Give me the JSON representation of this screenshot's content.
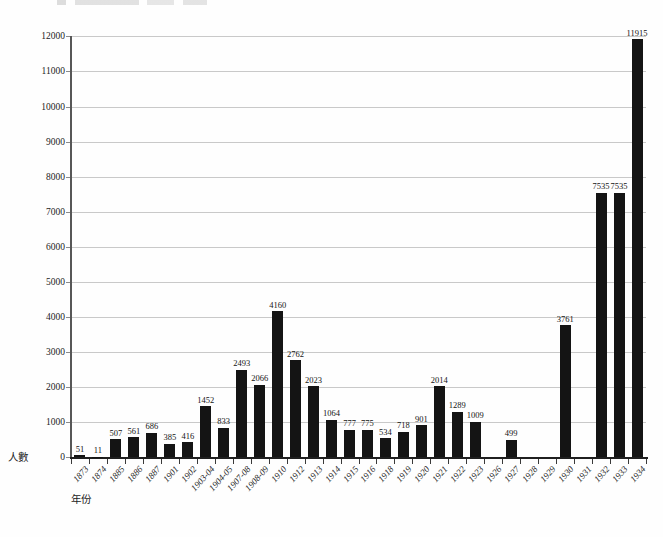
{
  "chart_data": {
    "type": "bar",
    "title": "",
    "xlabel": "年份",
    "ylabel": "人數",
    "categories": [
      "1873",
      "1874",
      "1885",
      "1886",
      "1887",
      "1901",
      "1902",
      "1903-04",
      "1904-05",
      "1907-08",
      "1908-09",
      "1910",
      "1912",
      "1913",
      "1914",
      "1915",
      "1916",
      "1918",
      "1919",
      "1920",
      "1921",
      "1922",
      "1923",
      "1926",
      "1927",
      "1928",
      "1929",
      "1930",
      "1931",
      "1932",
      "1933",
      "1934"
    ],
    "values": [
      51,
      11,
      507,
      561,
      686,
      385,
      416,
      1452,
      833,
      2493,
      2066,
      4160,
      2762,
      2023,
      1064,
      777,
      775,
      534,
      718,
      901,
      2014,
      1289,
      1009,
      0,
      499,
      0,
      0,
      3761,
      0,
      7535,
      7535,
      11915
    ],
    "value_labels_shown": true,
    "ylim": [
      0,
      12000
    ],
    "ytick_step": 1000,
    "grid": "horizontal",
    "legend": "none",
    "bar_color": "#141414",
    "gridline_color": "#c9c9c9"
  }
}
